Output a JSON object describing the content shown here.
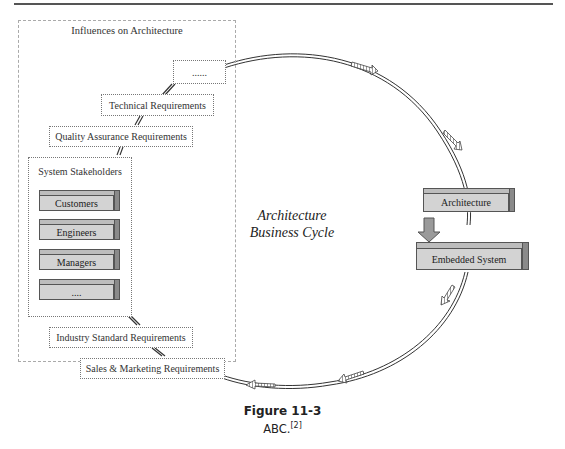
{
  "figure": {
    "title": "Figure 11-3",
    "caption": "ABC.",
    "reference": "[2]"
  },
  "diagram": {
    "center_label_line1": "Architecture",
    "center_label_line2": "Business Cycle",
    "influences_group": {
      "title": "Influences on Architecture",
      "items": [
        {
          "label": "......"
        },
        {
          "label": "Technical Requirements"
        },
        {
          "label": "Quality Assurance Requirements"
        },
        {
          "label": "Industry Standard Requirements"
        },
        {
          "label": "Sales & Marketing Requirements"
        }
      ],
      "stakeholders": {
        "title": "System Stakeholders",
        "items": [
          {
            "label": "Customers"
          },
          {
            "label": "Engineers"
          },
          {
            "label": "Managers"
          },
          {
            "label": "...."
          }
        ]
      }
    },
    "right_blocks": [
      {
        "label": "Architecture"
      },
      {
        "label": "Embedded System"
      }
    ],
    "cycle_direction": "clockwise",
    "colors": {
      "block_front": "#d3d3d3",
      "block_top": "#bdbdbd",
      "block_side": "#8a8a8a",
      "line": "#333333"
    }
  }
}
